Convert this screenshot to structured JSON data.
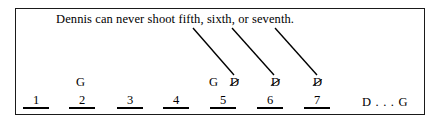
{
  "frame": {
    "border_color": "#1a1a1a",
    "background": "#ffffff"
  },
  "constraint": {
    "text": "Dennis can never shoot fifth, sixth, or seventh."
  },
  "markers": [
    {
      "id": "marker-slot2-g",
      "letter": "G",
      "struck": false,
      "left": 76
    },
    {
      "id": "marker-slot5-g",
      "letter": "G",
      "struck": false,
      "left": 209
    },
    {
      "id": "marker-slot5-d",
      "letter": "D",
      "struck": true,
      "left": 230
    },
    {
      "id": "marker-slot6-d",
      "letter": "D",
      "struck": true,
      "left": 271
    },
    {
      "id": "marker-slot7-d",
      "letter": "D",
      "struck": true,
      "left": 313
    }
  ],
  "slots": [
    {
      "number": "1",
      "left": 23
    },
    {
      "number": "2",
      "left": 69
    },
    {
      "number": "3",
      "left": 117
    },
    {
      "number": "4",
      "left": 163
    },
    {
      "number": "5",
      "left": 210
    },
    {
      "number": "6",
      "left": 257
    },
    {
      "number": "7",
      "left": 304
    }
  ],
  "sequence_note": {
    "text": "D . . . G"
  },
  "pointer_lines": [
    {
      "id": "pointer-line-fifth",
      "x1": 193,
      "y1": 28,
      "x2": 234,
      "y2": 75
    },
    {
      "id": "pointer-line-sixth",
      "x1": 232,
      "y1": 28,
      "x2": 274,
      "y2": 75
    },
    {
      "id": "pointer-line-seventh",
      "x1": 275,
      "y1": 28,
      "x2": 317,
      "y2": 75
    }
  ]
}
